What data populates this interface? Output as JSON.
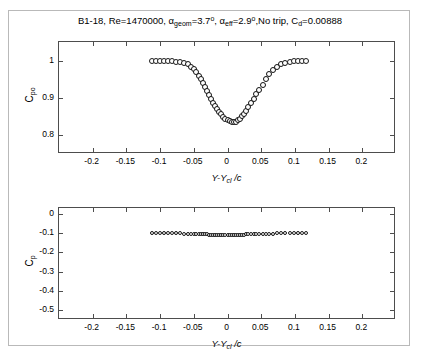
{
  "figure": {
    "title_parts": {
      "airfoil": "B1-18",
      "reynolds_label": "Re=",
      "reynolds_value": "1470000",
      "alpha_symbol": "α",
      "alpha_geom_sub": "geom",
      "alpha_geom_value": "=3.7",
      "alpha_eff_sub": "eff",
      "alpha_eff_value": "=2.9",
      "degree": "o",
      "trip": "No trip",
      "cd_symbol": "C",
      "cd_sub": "d",
      "cd_value": "=0.00888"
    },
    "title_text": "B1-18, Re=1470000, αgeom=3.7°, αeff=2.9°, No trip, Cd=0.00888"
  },
  "chart_data": [
    {
      "id": "wake-total-pressure",
      "type": "scatter",
      "title": "",
      "xlabel": "Y-Ycl /c",
      "ylabel": "Cpo",
      "xlim": [
        -0.25,
        0.25
      ],
      "ylim": [
        0.75,
        1.05
      ],
      "xticks": [
        -0.2,
        -0.15,
        -0.1,
        -0.05,
        0,
        0.05,
        0.1,
        0.15,
        0.2
      ],
      "xticklabels": [
        "-0.2",
        "-0.15",
        "-0.1",
        "-0.05",
        "0",
        "0.05",
        "0.1",
        "0.15",
        "0.2"
      ],
      "yticks": [
        0.8,
        0.9,
        1.0
      ],
      "yticklabels": [
        "0.8",
        "0.9",
        "1"
      ],
      "grid": false,
      "legend": "none",
      "marker": "open-circle",
      "x": [
        -0.112,
        -0.106,
        -0.1,
        -0.094,
        -0.088,
        -0.082,
        -0.076,
        -0.07,
        -0.064,
        -0.059,
        -0.054,
        -0.05,
        -0.046,
        -0.042,
        -0.039,
        -0.036,
        -0.033,
        -0.03,
        -0.027,
        -0.024,
        -0.021,
        -0.018,
        -0.015,
        -0.012,
        -0.009,
        -0.006,
        -0.003,
        0.0,
        0.003,
        0.006,
        0.009,
        0.012,
        0.015,
        0.018,
        0.021,
        0.024,
        0.027,
        0.031,
        0.035,
        0.039,
        0.043,
        0.047,
        0.052,
        0.057,
        0.062,
        0.068,
        0.074,
        0.08,
        0.086,
        0.092,
        0.098,
        0.104,
        0.11,
        0.116
      ],
      "y": [
        0.999,
        0.999,
        0.999,
        0.999,
        0.998,
        0.998,
        0.997,
        0.996,
        0.994,
        0.99,
        0.984,
        0.977,
        0.969,
        0.96,
        0.951,
        0.941,
        0.93,
        0.919,
        0.908,
        0.897,
        0.887,
        0.878,
        0.87,
        0.863,
        0.856,
        0.85,
        0.845,
        0.841,
        0.838,
        0.836,
        0.836,
        0.837,
        0.84,
        0.845,
        0.851,
        0.858,
        0.866,
        0.876,
        0.887,
        0.898,
        0.91,
        0.922,
        0.936,
        0.95,
        0.963,
        0.975,
        0.984,
        0.991,
        0.995,
        0.997,
        0.998,
        0.999,
        0.999,
        0.999
      ]
    },
    {
      "id": "wake-static-pressure",
      "type": "scatter",
      "title": "",
      "xlabel": "Y-Ycl /c",
      "ylabel": "Cp",
      "xlim": [
        -0.25,
        0.25
      ],
      "ylim": [
        -0.55,
        0.03
      ],
      "xticks": [
        -0.2,
        -0.15,
        -0.1,
        -0.05,
        0,
        0.05,
        0.1,
        0.15,
        0.2
      ],
      "xticklabels": [
        "-0.2",
        "-0.15",
        "-0.1",
        "-0.05",
        "0",
        "0.05",
        "0.1",
        "0.15",
        "0.2"
      ],
      "yticks": [
        0,
        -0.1,
        -0.2,
        -0.3,
        -0.4,
        -0.5
      ],
      "yticklabels": [
        "0",
        "-0.1",
        "-0.2",
        "-0.3",
        "-0.4",
        "-0.5"
      ],
      "grid": false,
      "legend": "none",
      "marker": "open-circle",
      "x": [
        -0.112,
        -0.106,
        -0.1,
        -0.094,
        -0.088,
        -0.082,
        -0.076,
        -0.07,
        -0.064,
        -0.059,
        -0.054,
        -0.05,
        -0.046,
        -0.042,
        -0.039,
        -0.036,
        -0.033,
        -0.03,
        -0.027,
        -0.024,
        -0.021,
        -0.018,
        -0.015,
        -0.012,
        -0.009,
        -0.006,
        -0.003,
        0.0,
        0.003,
        0.006,
        0.009,
        0.012,
        0.015,
        0.018,
        0.021,
        0.024,
        0.027,
        0.031,
        0.035,
        0.039,
        0.043,
        0.047,
        0.052,
        0.057,
        0.062,
        0.068,
        0.074,
        0.08,
        0.086,
        0.092,
        0.098,
        0.104,
        0.11,
        0.116
      ],
      "y": [
        -0.099,
        -0.099,
        -0.1,
        -0.1,
        -0.101,
        -0.101,
        -0.102,
        -0.102,
        -0.103,
        -0.103,
        -0.104,
        -0.104,
        -0.105,
        -0.105,
        -0.106,
        -0.106,
        -0.107,
        -0.107,
        -0.108,
        -0.108,
        -0.108,
        -0.109,
        -0.109,
        -0.109,
        -0.11,
        -0.11,
        -0.11,
        -0.11,
        -0.11,
        -0.11,
        -0.109,
        -0.109,
        -0.109,
        -0.108,
        -0.108,
        -0.108,
        -0.107,
        -0.107,
        -0.106,
        -0.106,
        -0.105,
        -0.105,
        -0.104,
        -0.104,
        -0.103,
        -0.103,
        -0.102,
        -0.102,
        -0.101,
        -0.101,
        -0.1,
        -0.1,
        -0.099,
        -0.099
      ]
    }
  ]
}
